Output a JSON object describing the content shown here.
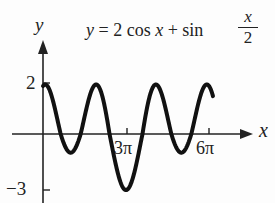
{
  "chart_data": {
    "type": "line",
    "title_parts": {
      "lhs": "y",
      "eq": "= 2 cos",
      "var": "x",
      "plus": "+ sin",
      "frac_num": "x",
      "frac_den": "2"
    },
    "xlabel": "x",
    "ylabel": "y",
    "x_ticks": [
      {
        "value": 9.4248,
        "label": "3π"
      },
      {
        "value": 18.8496,
        "label": "6π"
      }
    ],
    "y_ticks": [
      {
        "value": 2,
        "label": "2"
      },
      {
        "value": -3,
        "label": "−3"
      }
    ],
    "xlim": [
      -0.3,
      21.0
    ],
    "ylim": [
      -3.2,
      2.7
    ],
    "function": "2*cos(x) + sin(x/2)",
    "series": [
      {
        "name": "y = 2 cos x + sin(x/2)",
        "x_range": [
          0,
          19.3
        ],
        "samples": 400,
        "color": "#111111"
      }
    ],
    "grid": false,
    "legend": "none"
  }
}
